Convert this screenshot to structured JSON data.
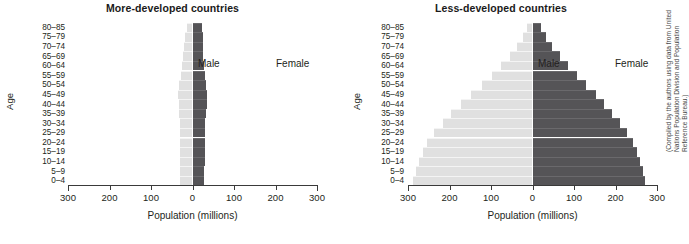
{
  "figure": {
    "credit": "(Compiled by the authors using data from United Nations Population Division and Population Reference Bureau.)"
  },
  "panels": {
    "left": {
      "title": "More-developed countries",
      "male_label": "Male",
      "female_label": "Female",
      "xlabel": "Population (millions)",
      "ylabel": "Age"
    },
    "right": {
      "title": "Less-developed countries",
      "male_label": "Male",
      "female_label": "Female",
      "xlabel": "Population (millions)",
      "ylabel": "Age"
    }
  },
  "axis": {
    "xticks": [
      "300",
      "200",
      "100",
      "0",
      "100",
      "200",
      "300"
    ],
    "xtick_values": [
      -300,
      -200,
      -100,
      0,
      100,
      200,
      300
    ],
    "xlim": [
      -300,
      300
    ],
    "age_groups": [
      "80–85",
      "75–79",
      "70–74",
      "65–69",
      "60–64",
      "55–59",
      "50–54",
      "45–49",
      "40–44",
      "35–39",
      "30–34",
      "25–29",
      "20–24",
      "15–19",
      "10–14",
      "5–9",
      "0–4"
    ]
  },
  "colors": {
    "male": "#e0e0e0",
    "female": "#555457",
    "axis": "#3a3a3a",
    "text": "#231f20",
    "background": "#ffffff"
  },
  "chart_data": [
    {
      "type": "bar",
      "subtype": "population-pyramid",
      "title": "More-developed countries",
      "xlabel": "Population (millions)",
      "ylabel": "Age",
      "xlim": [
        -300,
        300
      ],
      "grid": false,
      "legend": [
        "Male",
        "Female"
      ],
      "legend_position": "inside-top",
      "categories": [
        "80–85",
        "75–79",
        "70–74",
        "65–69",
        "60–64",
        "55–59",
        "50–54",
        "45–49",
        "40–44",
        "35–39",
        "30–34",
        "25–29",
        "20–24",
        "15–19",
        "10–14",
        "5–9",
        "0–4"
      ],
      "series": [
        {
          "name": "Male",
          "side": "left",
          "values": [
            13,
            17,
            21,
            22,
            26,
            28,
            32,
            34,
            33,
            32,
            31,
            31,
            30,
            30,
            30,
            29,
            29
          ]
        },
        {
          "name": "Female",
          "side": "right",
          "values": [
            22,
            25,
            26,
            25,
            28,
            30,
            33,
            35,
            34,
            32,
            31,
            30,
            29,
            29,
            29,
            28,
            28
          ]
        }
      ]
    },
    {
      "type": "bar",
      "subtype": "population-pyramid",
      "title": "Less-developed countries",
      "xlabel": "Population (millions)",
      "ylabel": "Age",
      "xlim": [
        -300,
        300
      ],
      "grid": false,
      "legend": [
        "Male",
        "Female"
      ],
      "legend_position": "inside-top",
      "categories": [
        "80–85",
        "75–79",
        "70–74",
        "65–69",
        "60–64",
        "55–59",
        "50–54",
        "45–49",
        "40–44",
        "35–39",
        "30–34",
        "25–29",
        "20–24",
        "15–19",
        "10–14",
        "5–9",
        "0–4"
      ],
      "series": [
        {
          "name": "Male",
          "side": "left",
          "values": [
            14,
            24,
            38,
            55,
            76,
            98,
            122,
            148,
            172,
            196,
            216,
            238,
            254,
            265,
            274,
            281,
            287
          ]
        },
        {
          "name": "Female",
          "side": "right",
          "values": [
            20,
            32,
            48,
            66,
            86,
            108,
            130,
            152,
            172,
            192,
            210,
            228,
            242,
            252,
            260,
            266,
            272
          ]
        }
      ]
    }
  ]
}
